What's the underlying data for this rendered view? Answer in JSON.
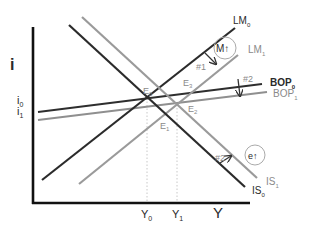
{
  "diagram": {
    "type": "IS-LM-BOP",
    "axes": {
      "y_label": "i",
      "x_label": "Y",
      "y_ticks": [
        {
          "label": "i",
          "sub": "0"
        },
        {
          "label": "i",
          "sub": "1"
        }
      ],
      "x_ticks": [
        {
          "label": "Y",
          "sub": "0"
        },
        {
          "label": "Y",
          "sub": "1"
        }
      ]
    },
    "curves": {
      "lm0": {
        "label": "LM",
        "sub": "0",
        "color": "#2b2b2b"
      },
      "lm1": {
        "label": "LM",
        "sub": "1",
        "color": "#9a9a9a"
      },
      "is0": {
        "label": "IS",
        "sub": "0",
        "color": "#2b2b2b"
      },
      "is1": {
        "label": "IS",
        "sub": "1",
        "color": "#9a9a9a"
      },
      "bop0": {
        "label": "BOP",
        "sub": "0",
        "color": "#2b2b2b"
      },
      "bop1": {
        "label": "BOP",
        "sub": "1",
        "color": "#8a8a8a"
      }
    },
    "equilibria": [
      {
        "label": "E",
        "sub": "0"
      },
      {
        "label": "E",
        "sub": "1"
      },
      {
        "label": "E",
        "sub": "2"
      },
      {
        "label": "E",
        "sub": "3"
      }
    ],
    "annotations": {
      "shift1": "#1",
      "shift2_bop": "#2",
      "shift2_is": "#2",
      "money_badge": "M↑",
      "exchange_badge": "e↑"
    }
  }
}
